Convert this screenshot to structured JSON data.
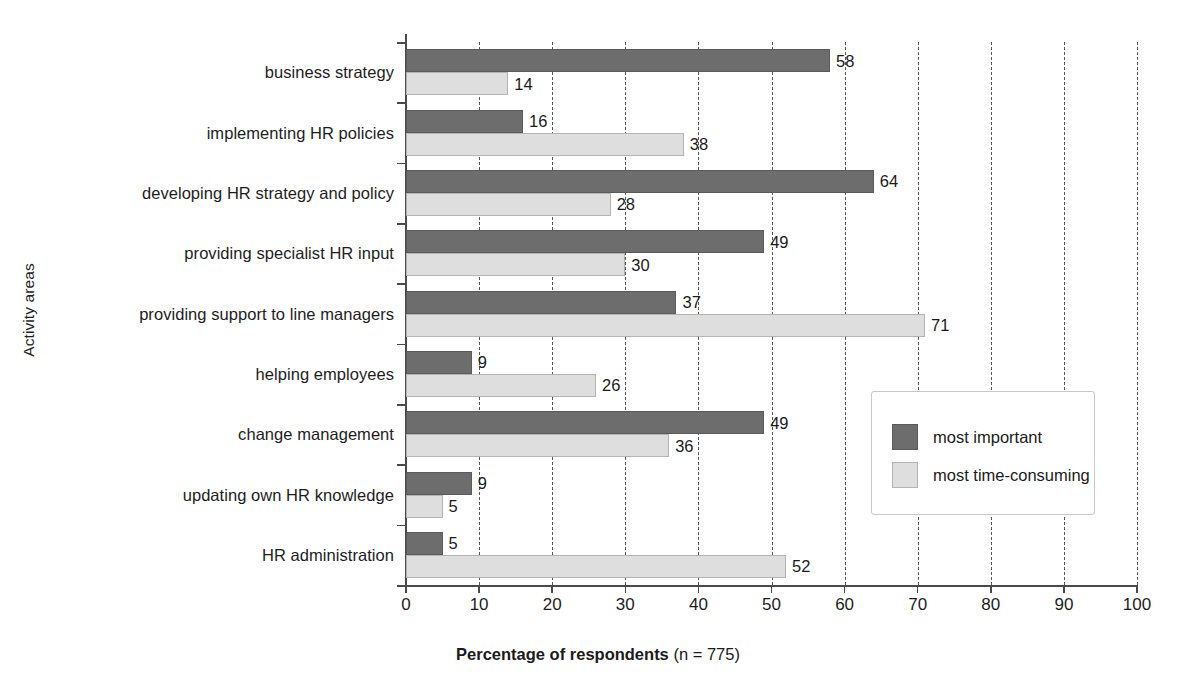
{
  "chart_data": {
    "type": "bar",
    "orientation": "horizontal",
    "title": "",
    "xlabel": "Percentage of respondents (n = 775)",
    "ylabel": "Activity areas",
    "xlim": [
      0,
      100
    ],
    "xticks": [
      0,
      10,
      20,
      30,
      40,
      50,
      60,
      70,
      80,
      90,
      100
    ],
    "xticklabels": [
      "0",
      "10",
      "20",
      "30",
      "40",
      "50",
      "60",
      "70",
      "80",
      "90",
      "100"
    ],
    "grid": "vertical-dashed",
    "legend_position": "center-right-inside",
    "categories": [
      "business strategy",
      "implementing HR policies",
      "developing HR strategy and policy",
      "providing specialist HR input",
      "providing support to line managers",
      "helping employees",
      "change management",
      "updating own HR knowledge",
      "HR administration"
    ],
    "series": [
      {
        "name": "most important",
        "color": "#6d6d6d",
        "values": [
          58,
          16,
          64,
          49,
          37,
          9,
          49,
          9,
          5
        ]
      },
      {
        "name": "most time-consuming",
        "color": "#dedede",
        "values": [
          14,
          38,
          28,
          30,
          71,
          26,
          36,
          5,
          52
        ]
      }
    ]
  },
  "axis": {
    "xlabel_main": "Percentage of respondents",
    "xlabel_note": "(n = 775)",
    "ylabel": "Activity areas"
  },
  "legend": {
    "items": [
      {
        "label": "most important",
        "swatch": "important"
      },
      {
        "label": "most time-consuming",
        "swatch": "timeconsuming"
      }
    ]
  }
}
